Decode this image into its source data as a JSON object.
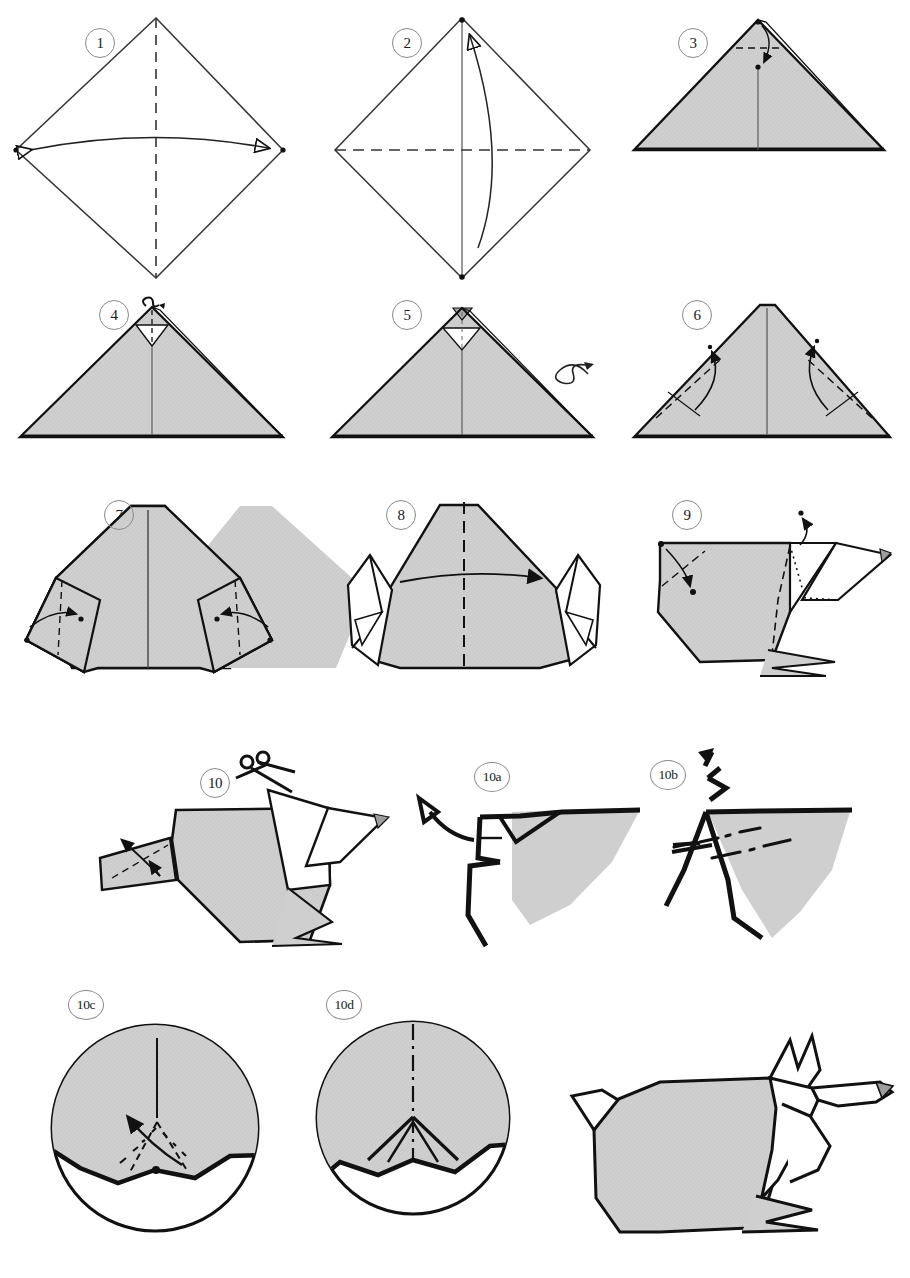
{
  "document": {
    "title": "Origami Fox / Wolf Folding Diagram",
    "type": "origami-instruction-sheet",
    "background_color": "#ffffff",
    "paper_fill_color": "#cfcfcf",
    "line_color": "#1a1a1a",
    "badge_border_color": "#8a8a8a"
  },
  "legend": {
    "valley_fold": "dashed line",
    "mountain_fold": "dash-dot line",
    "hidden_edge": "dotted line",
    "fold_arrow": "solid curved arrow",
    "turn_over": "looped arrow",
    "pleat": "zigzag arrow",
    "cut": "scissors icon"
  },
  "steps": [
    {
      "id": "1",
      "label": "1",
      "badge_x": 85,
      "badge_y": 28,
      "caption": "Square diamond, valley fold in half vertically"
    },
    {
      "id": "2",
      "label": "2",
      "badge_x": 392,
      "badge_y": 28,
      "caption": "Valley fold in half horizontally, bottom to top"
    },
    {
      "id": "3",
      "label": "3",
      "badge_x": 678,
      "badge_y": 28,
      "caption": "Fold the top point down a small amount"
    },
    {
      "id": "4",
      "label": "4",
      "badge_x": 99,
      "badge_y": 300,
      "caption": "Fold the tip back up, slightly"
    },
    {
      "id": "5",
      "label": "5",
      "badge_x": 392,
      "badge_y": 300,
      "caption": "Result; turn the model over"
    },
    {
      "id": "6",
      "label": "6",
      "badge_x": 682,
      "badge_y": 300,
      "caption": "Fold both lower corners up along the dashed lines"
    },
    {
      "id": "7",
      "label": "7",
      "badge_x": 104,
      "badge_y": 500,
      "caption": "Fold the two side flaps in along the dashed lines"
    },
    {
      "id": "8",
      "label": "8",
      "badge_x": 386,
      "badge_y": 500,
      "caption": "Mountain fold the model in half from left to right"
    },
    {
      "id": "9",
      "label": "9",
      "badge_x": 672,
      "badge_y": 500,
      "caption": "Inside reverse fold the tail and shape the head"
    },
    {
      "id": "10",
      "label": "10",
      "badge_x": 207,
      "badge_y": 768,
      "caption": "Cut along the indicated line; shape the tail"
    },
    {
      "id": "10a",
      "label": "10a",
      "badge_x": 478,
      "badge_y": 762,
      "caption": "Detail: pull the tail flap outward"
    },
    {
      "id": "10b",
      "label": "10b",
      "badge_x": 654,
      "badge_y": 760,
      "caption": "Detail: pleat fold along the dash-dot lines"
    },
    {
      "id": "10c",
      "label": "10c",
      "badge_x": 72,
      "badge_y": 990,
      "caption": "Close-up: valley and mountain folds to form the ears"
    },
    {
      "id": "10d",
      "label": "10d",
      "badge_x": 330,
      "badge_y": 990,
      "caption": "Close-up: finished ear pleat"
    },
    {
      "id": "final",
      "label": "",
      "badge_x": 0,
      "badge_y": 0,
      "caption": "Completed origami fox"
    }
  ]
}
